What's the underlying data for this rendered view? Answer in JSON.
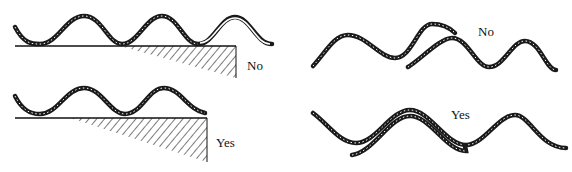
{
  "panels": [
    {
      "id": "top-left",
      "label": "No",
      "description": "Wave resting on ledge, extends past edge"
    },
    {
      "id": "bottom-left",
      "label": "Yes",
      "description": "Wave ends at ledge edge"
    },
    {
      "id": "top-right",
      "label": "No",
      "description": "Two waves overlapping out of phase"
    },
    {
      "id": "bottom-right",
      "label": "Yes",
      "description": "Two waves overlapping in phase"
    }
  ],
  "colors": {
    "stroke": "#1a1a1a",
    "background": "#ffffff"
  }
}
